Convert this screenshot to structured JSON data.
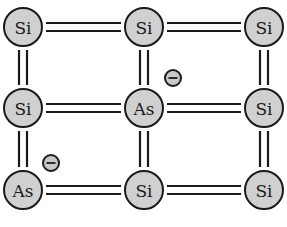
{
  "diagram": {
    "title": "",
    "colors": {
      "atom_fill": "#d0d0d0",
      "stroke": "#1a1a1a",
      "background": "#ffffff"
    },
    "columns_x": [
      23,
      144,
      264
    ],
    "rows_y": [
      27,
      108,
      190
    ],
    "atom_radius": 19,
    "atoms": [
      {
        "row": 0,
        "col": 0,
        "label": "Si"
      },
      {
        "row": 0,
        "col": 1,
        "label": "Si"
      },
      {
        "row": 0,
        "col": 2,
        "label": "Si"
      },
      {
        "row": 1,
        "col": 0,
        "label": "Si"
      },
      {
        "row": 1,
        "col": 1,
        "label": "As"
      },
      {
        "row": 1,
        "col": 2,
        "label": "Si"
      },
      {
        "row": 2,
        "col": 0,
        "label": "As"
      },
      {
        "row": 2,
        "col": 1,
        "label": "Si"
      },
      {
        "row": 2,
        "col": 2,
        "label": "Si"
      }
    ],
    "bonds": [
      {
        "from": [
          0,
          0
        ],
        "to": [
          0,
          1
        ],
        "type": "double"
      },
      {
        "from": [
          0,
          1
        ],
        "to": [
          0,
          2
        ],
        "type": "double"
      },
      {
        "from": [
          1,
          0
        ],
        "to": [
          1,
          1
        ],
        "type": "double"
      },
      {
        "from": [
          1,
          1
        ],
        "to": [
          1,
          2
        ],
        "type": "double"
      },
      {
        "from": [
          2,
          0
        ],
        "to": [
          2,
          1
        ],
        "type": "double"
      },
      {
        "from": [
          2,
          1
        ],
        "to": [
          2,
          2
        ],
        "type": "double"
      },
      {
        "from": [
          0,
          0
        ],
        "to": [
          1,
          0
        ],
        "type": "double"
      },
      {
        "from": [
          1,
          0
        ],
        "to": [
          2,
          0
        ],
        "type": "double"
      },
      {
        "from": [
          0,
          1
        ],
        "to": [
          1,
          1
        ],
        "type": "double"
      },
      {
        "from": [
          1,
          1
        ],
        "to": [
          2,
          1
        ],
        "type": "double"
      },
      {
        "from": [
          0,
          2
        ],
        "to": [
          1,
          2
        ],
        "type": "double"
      },
      {
        "from": [
          1,
          2
        ],
        "to": [
          2,
          2
        ],
        "type": "double"
      }
    ],
    "electrons": [
      {
        "x": 173,
        "y": 78,
        "symbol": "−",
        "label": "free-electron"
      },
      {
        "x": 51,
        "y": 163,
        "symbol": "−",
        "label": "free-electron"
      }
    ],
    "electron_radius": 8
  }
}
